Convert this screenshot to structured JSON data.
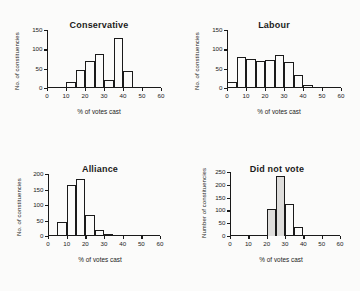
{
  "figure": {
    "background": "#fbfbfa",
    "ink": "#1a1a1a",
    "shade": "#dedddb"
  },
  "chart_data": [
    {
      "type": "bar",
      "title": "Conservative",
      "xlabel": "% of votes cast",
      "ylabel": "No. of constituencies",
      "xlim": [
        0,
        60
      ],
      "ylim": [
        0,
        150
      ],
      "xticks": [
        0,
        10,
        20,
        30,
        40,
        50,
        60
      ],
      "yticks": [
        0,
        50,
        100,
        150
      ],
      "bin_width": 5,
      "grid": false,
      "legend": "none",
      "bin_starts": [
        10,
        15,
        20,
        25,
        30,
        35,
        40
      ],
      "values": [
        15,
        47,
        70,
        88,
        20,
        130,
        44
      ],
      "shaded": false
    },
    {
      "type": "bar",
      "title": "Labour",
      "xlabel": "% of votes cast",
      "ylabel": "No. of constituencies",
      "xlim": [
        0,
        60
      ],
      "ylim": [
        0,
        150
      ],
      "xticks": [
        0,
        10,
        20,
        30,
        40,
        50,
        60
      ],
      "yticks": [
        0,
        50,
        100,
        150
      ],
      "bin_width": 5,
      "grid": false,
      "legend": "none",
      "bin_starts": [
        0,
        5,
        10,
        15,
        20,
        25,
        30,
        35,
        40,
        45
      ],
      "values": [
        16,
        80,
        76,
        69,
        73,
        85,
        68,
        34,
        8,
        2
      ],
      "shaded": false
    },
    {
      "type": "bar",
      "title": "Alliance",
      "xlabel": "% of votes cast",
      "ylabel": "No. of constituencies",
      "xlim": [
        0,
        60
      ],
      "ylim": [
        0,
        200
      ],
      "xticks": [
        0,
        10,
        20,
        30,
        40,
        50,
        60
      ],
      "yticks": [
        0,
        50,
        100,
        150,
        200
      ],
      "bin_width": 5,
      "grid": false,
      "legend": "none",
      "bin_starts": [
        0,
        5,
        10,
        15,
        20,
        25,
        30,
        35
      ],
      "values": [
        3,
        46,
        165,
        185,
        69,
        20,
        6,
        2
      ],
      "shaded": false
    },
    {
      "type": "bar",
      "title": "Did not vote",
      "xlabel": "% of votes cast",
      "ylabel": "Number of constituencies",
      "xlim": [
        0,
        60
      ],
      "ylim": [
        0,
        250
      ],
      "xticks": [
        0,
        10,
        20,
        30,
        40,
        50,
        60
      ],
      "yticks": [
        0,
        50,
        100,
        150,
        200,
        250
      ],
      "bin_width": 5,
      "grid": false,
      "legend": "none",
      "bin_starts": [
        15,
        20,
        25,
        30,
        35,
        40,
        45
      ],
      "values": [
        3,
        105,
        235,
        124,
        36,
        5,
        3
      ],
      "shaded": true,
      "shaded_bins": [
        20,
        25
      ]
    }
  ]
}
